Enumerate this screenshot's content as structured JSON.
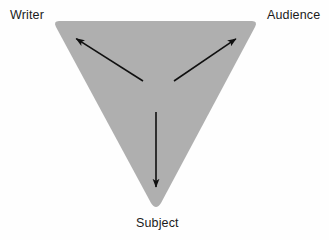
{
  "diagram": {
    "type": "triangle-relationship-diagram",
    "canvas": {
      "width": 329,
      "height": 240,
      "background_color": "#fefefe"
    },
    "shape": {
      "name": "inverted-triangle",
      "fill_color": "#afafaf",
      "stroke": "none",
      "corner_radius": 6,
      "vertices": [
        {
          "id": "top-left",
          "x": 53,
          "y": 21
        },
        {
          "id": "top-right",
          "x": 258,
          "y": 21
        },
        {
          "id": "bottom",
          "x": 156,
          "y": 207
        }
      ]
    },
    "hub": {
      "x": 158,
      "y": 92
    },
    "arrow_color": "#101010",
    "arrow_width": 1.6,
    "arrows": [
      {
        "id": "arrow-to-writer",
        "label": "Writer",
        "from": {
          "x": 143,
          "y": 81
        },
        "to": {
          "x": 72,
          "y": 36
        },
        "direction": "up-left"
      },
      {
        "id": "arrow-to-audience",
        "label": "Audience",
        "from": {
          "x": 174,
          "y": 81
        },
        "to": {
          "x": 240,
          "y": 36
        },
        "direction": "up-right"
      },
      {
        "id": "arrow-to-subject",
        "label": "Subject",
        "from": {
          "x": 156,
          "y": 112
        },
        "to": {
          "x": 156,
          "y": 192
        },
        "direction": "down"
      }
    ],
    "labels": {
      "writer": "Writer",
      "audience": "Audience",
      "subject": "Subject"
    }
  }
}
